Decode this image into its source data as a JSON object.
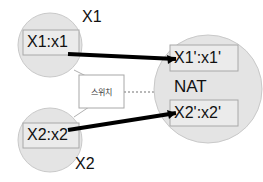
{
  "diagram": {
    "colors": {
      "circle_fill": "#e4e4e4",
      "circle_stroke": "#c9c9c9",
      "box_fill": "#ebebeb",
      "box_stroke": "#a8a8a8",
      "switch_fill": "#ffffff",
      "link_color": "#000000",
      "dotted_link_color": "#b8b8b8",
      "background": "#ffffff",
      "text_color": "#111111"
    },
    "nodes": {
      "host1": {
        "outer_label": "X1",
        "address": "X1:x1"
      },
      "host2": {
        "outer_label": "X2",
        "address": "X2:x2"
      },
      "switch": {
        "label": "스위치"
      },
      "nat": {
        "label": "NAT",
        "address_top": "X1':x1'",
        "address_bottom": "X2':x2'"
      }
    },
    "links": [
      {
        "name": "host1-to-nat",
        "style": "thick-solid"
      },
      {
        "name": "host2-to-nat",
        "style": "thick-solid"
      },
      {
        "name": "host1-to-switch",
        "style": "thin-solid"
      },
      {
        "name": "host2-to-switch",
        "style": "thin-solid"
      },
      {
        "name": "switch-to-nat",
        "style": "dotted"
      }
    ]
  }
}
